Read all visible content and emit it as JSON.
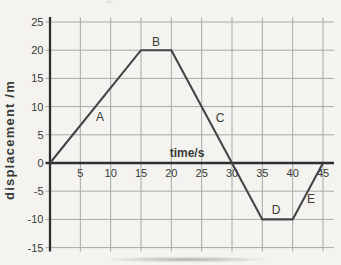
{
  "figure": {
    "background": "#f6f5f1"
  },
  "chart_data": {
    "type": "line",
    "title": "",
    "xlabel": "time/s",
    "ylabel": "displacement /m",
    "xlim": [
      0,
      45
    ],
    "ylim": [
      -15,
      25
    ],
    "x_ticks": [
      5,
      10,
      15,
      20,
      25,
      30,
      35,
      40,
      45
    ],
    "y_ticks": [
      25,
      20,
      15,
      10,
      5,
      0,
      -5,
      -10,
      -15
    ],
    "grid": true,
    "legend": false,
    "series": [
      {
        "name": "displacement",
        "x": [
          0,
          15,
          20,
          35,
          40,
          45
        ],
        "y": [
          0,
          20,
          20,
          -10,
          -10,
          0
        ]
      }
    ],
    "segment_labels": [
      {
        "label": "A",
        "x_px": 100,
        "y_px": 121
      },
      {
        "label": "B",
        "x_px": 156,
        "y_px": 46
      },
      {
        "label": "C",
        "x_px": 220,
        "y_px": 122
      },
      {
        "label": "D",
        "x_px": 276,
        "y_px": 214
      },
      {
        "label": "E",
        "x_px": 311,
        "y_px": 203
      }
    ],
    "colors": {
      "line": "#454549",
      "axis": "#2e2e2e",
      "grid": "#a6aaa4",
      "text": "#3a3a38"
    }
  }
}
